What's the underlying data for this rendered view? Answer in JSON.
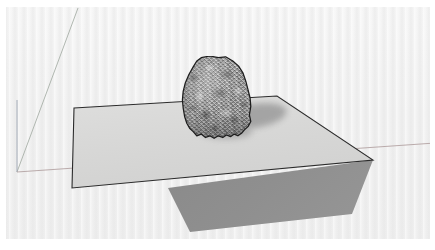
{
  "app": {
    "name": "3D modeling viewport",
    "scene_title": "Rock on ground plane",
    "description": "Isometric 3D view of a textured grey boulder resting on a thin rectangular plane, with the plane and boulder casting shadows onto the ground."
  },
  "viewport": {
    "width": 435,
    "height": 250,
    "background_color": "#f1f1f1",
    "page_border_color": "#ffffff"
  },
  "axes": {
    "origin": {
      "x": 17,
      "y": 172
    },
    "lines": [
      {
        "name": "blue-axis",
        "label": "Blue axis (up)",
        "color": "#9aa3b0",
        "x1": 17,
        "y1": 100,
        "x2": 17,
        "y2": 172
      },
      {
        "name": "green-axis",
        "label": "Green axis (depth)",
        "color": "#a8b0a8",
        "x1": 78,
        "y1": 8,
        "x2": 17,
        "y2": 172
      },
      {
        "name": "red-axis",
        "label": "Red axis (width)",
        "color": "#b3a3a3",
        "x1": 17,
        "y1": 172,
        "x2": 435,
        "y2": 143
      }
    ]
  },
  "objects": [
    {
      "name": "ground-plane",
      "label": "Rectangular ground plane",
      "fill_color": "#d9d9d9",
      "edge_color": "#2b2b2b",
      "edge_width": 1.1,
      "corners": [
        {
          "x": 74,
          "y": 108
        },
        {
          "x": 277,
          "y": 96
        },
        {
          "x": 373,
          "y": 160
        },
        {
          "x": 72,
          "y": 188
        }
      ]
    },
    {
      "name": "plane-cast-shadow",
      "label": "Shadow cast by ground plane",
      "fill_color": "#8c8c8c",
      "opacity": 1,
      "corners": [
        {
          "x": 168,
          "y": 188
        },
        {
          "x": 373,
          "y": 160
        },
        {
          "x": 352,
          "y": 214
        },
        {
          "x": 190,
          "y": 232
        }
      ]
    },
    {
      "name": "rock-cast-shadow",
      "label": "Shadow cast by rock onto plane",
      "fill_color": "#a9a9a9",
      "opacity": 0.85,
      "center": {
        "x": 256,
        "y": 117
      },
      "radius_x": 36,
      "radius_y": 13,
      "rotation_deg": -9
    },
    {
      "name": "rock-boulder",
      "label": "Textured rock boulder",
      "outline_color": "#1d1d1d",
      "base_color": "#a0a0a0",
      "highlight_color": "#d8d8d8",
      "shadow_color": "#5a5a5a",
      "bounds": {
        "x": 181,
        "y": 56,
        "width": 72,
        "height": 84
      }
    }
  ],
  "artifacts": [
    {
      "name": "scrollbar-fragment",
      "label": "Faint scrollbar fragment",
      "x": 207,
      "y": 243,
      "width": 16,
      "height": 3,
      "color": "#e4e4e4"
    }
  ]
}
